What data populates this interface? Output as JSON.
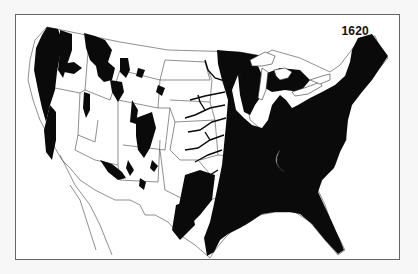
{
  "map": {
    "year_label": "1620",
    "subject": "Virgin forest cover of the contiguous United States",
    "colors": {
      "forest": "#0a0a0a",
      "background": "#ffffff",
      "border": "#666666",
      "state_lines": "#555555"
    }
  }
}
